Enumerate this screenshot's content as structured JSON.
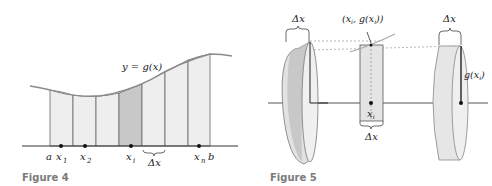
{
  "figure4": {
    "caption": "Figure 4",
    "curve_label": "y = g(x)",
    "x_labels": {
      "a": "a",
      "x1": "x",
      "x1_sub": "1",
      "x2": "x",
      "x2_sub": "2",
      "xi": "x",
      "xi_sub": "i",
      "xn": "x",
      "xn_sub": "n",
      "b": "b"
    },
    "delta_label": "Δx",
    "colors": {
      "strip_fill": "#eeeeee",
      "highlight_fill": "#c8c8c8",
      "curve": "#8a8a8a",
      "axis": "#333333"
    }
  },
  "figure5": {
    "caption": "Figure 5",
    "left_delta_label": "Δx",
    "right_delta_label": "Δx",
    "point_label": "(x_i, g(x_i))",
    "point_label_parts": {
      "open": "(x",
      "sub1": "i",
      "mid": ", g(x",
      "sub2": "i",
      "close": "))"
    },
    "center_x_label": "x",
    "center_x_sub": "i",
    "center_delta_label": "Δx",
    "radius_label": "g(x",
    "radius_sub": "i",
    "radius_close": ")",
    "colors": {
      "disk_fill": "#e6e6e6",
      "disk_dark": "#bdbdbd",
      "axis": "#333333"
    }
  }
}
